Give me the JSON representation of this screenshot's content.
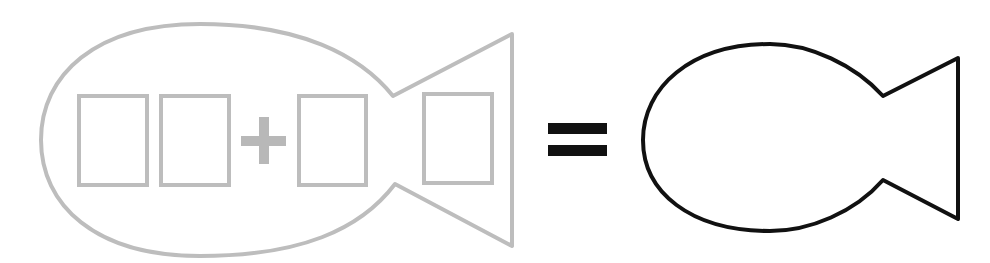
{
  "diagram": {
    "colors": {
      "outline_gray": "#bdbdbd",
      "plus_gray": "#b8b8b8",
      "black": "#111111",
      "background": "#ffffff"
    },
    "left_fish": {
      "boxes": [
        {
          "x": 79,
          "y": 96,
          "w": 68,
          "h": 89
        },
        {
          "x": 161,
          "y": 96,
          "w": 68,
          "h": 89
        },
        {
          "x": 299,
          "y": 96,
          "w": 67,
          "h": 89
        },
        {
          "x": 424,
          "y": 94,
          "w": 68,
          "h": 89
        }
      ],
      "operator": "plus"
    },
    "equals_sign": true,
    "right_fish": {
      "empty": true
    }
  }
}
